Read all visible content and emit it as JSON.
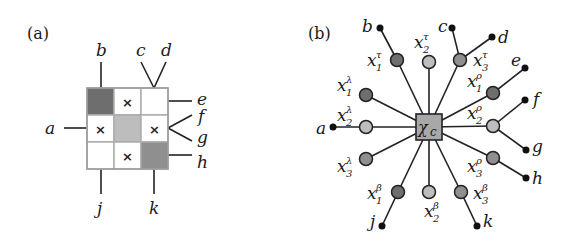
{
  "panel_a": {
    "label": "(a)",
    "cells": [
      {
        "shade": "dark",
        "mark": ""
      },
      {
        "shade": "white",
        "mark": "×"
      },
      {
        "shade": "white",
        "mark": ""
      },
      {
        "shade": "white",
        "mark": "×"
      },
      {
        "shade": "light",
        "mark": ""
      },
      {
        "shade": "white",
        "mark": "×"
      },
      {
        "shade": "white",
        "mark": ""
      },
      {
        "shade": "white",
        "mark": "×"
      },
      {
        "shade": "medium",
        "mark": ""
      }
    ],
    "legs": {
      "a": "a",
      "b": "b",
      "c": "c",
      "d": "d",
      "e": "e",
      "f": "f",
      "g": "g",
      "h": "h",
      "j": "j",
      "k": "k"
    }
  },
  "panel_b": {
    "label": "(b)",
    "center": {
      "base": "χ",
      "sub": "c"
    },
    "nodes": [
      {
        "id": "x1t",
        "base": "x",
        "sub": "1",
        "sup": "τ",
        "shade": "dark"
      },
      {
        "id": "x2t",
        "base": "x",
        "sub": "2",
        "sup": "τ",
        "shade": "light"
      },
      {
        "id": "x3t",
        "base": "x",
        "sub": "3",
        "sup": "τ",
        "shade": "medium"
      },
      {
        "id": "x1l",
        "base": "x",
        "sub": "1",
        "sup": "λ",
        "shade": "dark"
      },
      {
        "id": "x2l",
        "base": "x",
        "sub": "2",
        "sup": "λ",
        "shade": "light"
      },
      {
        "id": "x3l",
        "base": "x",
        "sub": "3",
        "sup": "λ",
        "shade": "medium"
      },
      {
        "id": "x1r",
        "base": "x",
        "sub": "1",
        "sup": "ρ",
        "shade": "dark"
      },
      {
        "id": "x2r",
        "base": "x",
        "sub": "2",
        "sup": "ρ",
        "shade": "light"
      },
      {
        "id": "x3r",
        "base": "x",
        "sub": "3",
        "sup": "ρ",
        "shade": "medium"
      },
      {
        "id": "x1b",
        "base": "x",
        "sub": "1",
        "sup": "β",
        "shade": "dark"
      },
      {
        "id": "x2b",
        "base": "x",
        "sub": "2",
        "sup": "β",
        "shade": "light"
      },
      {
        "id": "x3b",
        "base": "x",
        "sub": "3",
        "sup": "β",
        "shade": "medium"
      }
    ],
    "legs": {
      "a": "a",
      "b": "b",
      "c": "c",
      "d": "d",
      "e": "e",
      "f": "f",
      "g": "g",
      "h": "h",
      "j": "j",
      "k": "k"
    }
  },
  "colors": {
    "dark": "#6e6e6e",
    "medium": "#8f8f8f",
    "light": "#bdbdbd",
    "white": "#ffffff",
    "line": "#222222"
  }
}
